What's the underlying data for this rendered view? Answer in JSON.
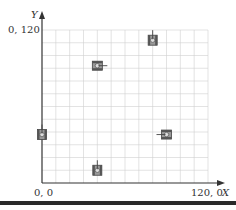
{
  "diagram": {
    "axis_x_label": "X",
    "axis_y_label": "Y",
    "origin_label": "0, 0",
    "y_max_label": "0, 120",
    "x_max_label": "120, 0",
    "grid_divisions": 12,
    "range": [
      0,
      120
    ],
    "colors": {
      "grid": "#d0d0d0",
      "axis": "#333333",
      "tank": "#555555"
    }
  },
  "tanks": [
    {
      "x": 40,
      "y": 92,
      "facing": "right"
    },
    {
      "x": 80,
      "y": 112,
      "facing": "up"
    },
    {
      "x": 0,
      "y": 38,
      "facing": "up"
    },
    {
      "x": 40,
      "y": 10,
      "facing": "up"
    },
    {
      "x": 90,
      "y": 38,
      "facing": "left"
    }
  ]
}
